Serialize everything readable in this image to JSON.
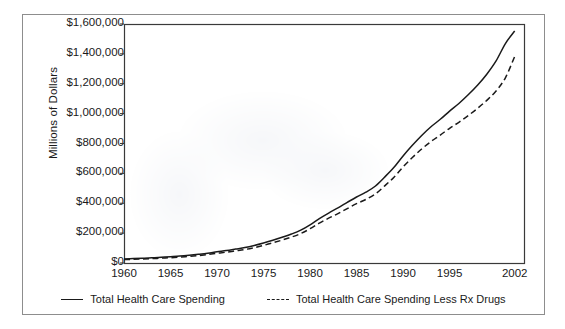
{
  "chart_data": {
    "type": "line",
    "title": "",
    "subtitle": "",
    "xlabel": "",
    "ylabel": "Millions of Dollars",
    "xlim": [
      1960,
      2003
    ],
    "ylim": [
      0,
      1600000
    ],
    "grid": false,
    "legend_position": "bottom",
    "x_tick_labels": [
      "1960",
      "1965",
      "1970",
      "1975",
      "1980",
      "1985",
      "1990",
      "1995",
      "2002"
    ],
    "x_tick_values": [
      1960,
      1965,
      1970,
      1975,
      1980,
      1985,
      1990,
      1995,
      2002
    ],
    "y_tick_labels": [
      "$1,600,000",
      "$1,400,000",
      "$1,200,000",
      "$1,000,000",
      "$800,000",
      "$600,000",
      "$400,000",
      "$200,000",
      "$0"
    ],
    "y_tick_values": [
      1600000,
      1400000,
      1200000,
      1000000,
      800000,
      600000,
      400000,
      200000,
      0
    ],
    "x": [
      1960,
      1961,
      1962,
      1963,
      1964,
      1965,
      1966,
      1967,
      1968,
      1969,
      1970,
      1971,
      1972,
      1973,
      1974,
      1975,
      1976,
      1977,
      1978,
      1979,
      1980,
      1981,
      1982,
      1983,
      1984,
      1985,
      1986,
      1987,
      1988,
      1989,
      1990,
      1991,
      1992,
      1993,
      1994,
      1995,
      1996,
      1997,
      1998,
      1999,
      2000,
      2001,
      2002
    ],
    "series": [
      {
        "name": "Total Health Care Spending",
        "style": "solid",
        "color": "#1a1a1a",
        "values": [
          27500,
          29400,
          31800,
          34600,
          38400,
          42000,
          46100,
          51700,
          58100,
          65400,
          74900,
          83200,
          93100,
          103100,
          117000,
          133500,
          152200,
          172400,
          194000,
          220000,
          255800,
          297500,
          334500,
          369000,
          406000,
          442000,
          474000,
          514000,
          574000,
          639000,
          717000,
          788000,
          854000,
          912000,
          962000,
          1017000,
          1068000,
          1126000,
          1190000,
          1264000,
          1353000,
          1469000,
          1553000
        ]
      },
      {
        "name": "Total Health Care Spending Less Rx Drugs",
        "style": "dashed",
        "color": "#1a1a1a",
        "values": [
          23100,
          24700,
          26800,
          29200,
          32500,
          35600,
          39200,
          44300,
          50000,
          56500,
          65000,
          72500,
          81400,
          90400,
          103000,
          118000,
          135000,
          153500,
          173500,
          197000,
          229500,
          267000,
          300000,
          331000,
          364500,
          397000,
          425500,
          461000,
          515000,
          573000,
          643000,
          706000,
          763000,
          813000,
          856000,
          902000,
          942000,
          987000,
          1035000,
          1089000,
          1152000,
          1240000,
          1383000
        ]
      }
    ]
  },
  "axis": {
    "y_label": "Millions of Dollars"
  },
  "legend": {
    "items": [
      {
        "label": "Total Health Care Spending",
        "style": "solid"
      },
      {
        "label": "Total Health Care Spending Less Rx Drugs",
        "style": "dashed"
      }
    ]
  }
}
